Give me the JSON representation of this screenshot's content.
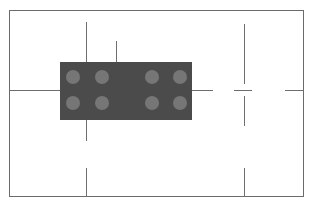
{
  "drawing": {
    "title": "technical-part-drawing",
    "background_color": "#ffffff",
    "frame": {
      "label": "drawing-border",
      "stroke_color": "#6b6b6b",
      "x": 9,
      "y": 10,
      "width": 295,
      "height": 187,
      "stroke_width": 1
    },
    "part": {
      "label": "rectangular-component",
      "fill_color": "#4b4b4b",
      "x": 60,
      "y": 62,
      "width": 132,
      "height": 58
    },
    "holes": {
      "label": "circular-features",
      "fill_color": "#767676",
      "rows": 2,
      "columns": 4,
      "diameter": 14,
      "count": 8,
      "items": [
        {
          "name": "hole-r1-c1",
          "cx": 73,
          "cy": 77,
          "r": 7
        },
        {
          "name": "hole-r1-c2",
          "cx": 102,
          "cy": 77,
          "r": 7
        },
        {
          "name": "hole-r1-c3",
          "cx": 152,
          "cy": 77,
          "r": 7
        },
        {
          "name": "hole-r1-c4",
          "cx": 180,
          "cy": 77,
          "r": 7
        },
        {
          "name": "hole-r2-c1",
          "cx": 73,
          "cy": 103,
          "r": 7
        },
        {
          "name": "hole-r2-c2",
          "cx": 102,
          "cy": 103,
          "r": 7
        },
        {
          "name": "hole-r2-c3",
          "cx": 152,
          "cy": 103,
          "r": 7
        },
        {
          "name": "hole-r2-c4",
          "cx": 180,
          "cy": 103,
          "r": 7
        }
      ]
    },
    "construction_lines": {
      "label": "centerlines-and-registration-marks",
      "stroke_color": "#6e6e6e",
      "vertical": [
        {
          "name": "centerline-vertical-upper-long",
          "x": 86,
          "y": 22,
          "length": 50
        },
        {
          "name": "centerline-vertical-upper-short",
          "x": 116,
          "y": 41,
          "length": 31
        },
        {
          "name": "centerline-vertical-lower",
          "x": 86,
          "y": 120,
          "length": 21
        },
        {
          "name": "centerline-vertical-bottom",
          "x": 86,
          "y": 168,
          "length": 29
        },
        {
          "name": "crosshair-arm-top",
          "x": 244,
          "y": 24,
          "length": 60
        },
        {
          "name": "crosshair-arm-bottom",
          "x": 244,
          "y": 96,
          "length": 30
        },
        {
          "name": "centerline-vertical-bottom-right",
          "x": 244,
          "y": 168,
          "length": 29
        }
      ],
      "horizontal": [
        {
          "name": "centerline-horizontal-left",
          "y": 90,
          "x": 10,
          "length": 50
        },
        {
          "name": "centerline-horizontal-right",
          "y": 90,
          "x": 192,
          "length": 21
        },
        {
          "name": "crosshair-arm-left",
          "y": 90,
          "x": 234,
          "length": 18
        },
        {
          "name": "centerline-horizontal-edge",
          "y": 90,
          "x": 285,
          "length": 19
        }
      ]
    }
  }
}
